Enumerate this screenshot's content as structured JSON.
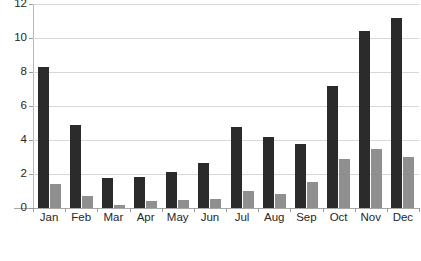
{
  "chart_data": {
    "type": "bar",
    "title": "",
    "xlabel": "",
    "ylabel": "",
    "ylim": [
      0,
      12
    ],
    "yticks": [
      0,
      2,
      4,
      6,
      8,
      10,
      12
    ],
    "grid": true,
    "legend": "none",
    "categories": [
      "Jan",
      "Feb",
      "Mar",
      "Apr",
      "May",
      "Jun",
      "Jul",
      "Aug",
      "Sep",
      "Oct",
      "Nov",
      "Dec"
    ],
    "series": [
      {
        "name": "series-1",
        "color": "#2b2b2b",
        "values": [
          8.3,
          4.9,
          1.75,
          1.8,
          2.1,
          2.65,
          4.75,
          4.15,
          3.75,
          7.2,
          10.4,
          11.2
        ]
      },
      {
        "name": "series-2",
        "color": "#8f8f8f",
        "values": [
          1.4,
          0.7,
          0.2,
          0.4,
          0.45,
          0.55,
          1.0,
          0.8,
          1.55,
          2.9,
          3.5,
          3.0
        ]
      }
    ]
  },
  "colors": {
    "background": "#ffffff",
    "gridline": "#d8d8d8",
    "axis": "#a8a8a8",
    "text": "#262626"
  }
}
